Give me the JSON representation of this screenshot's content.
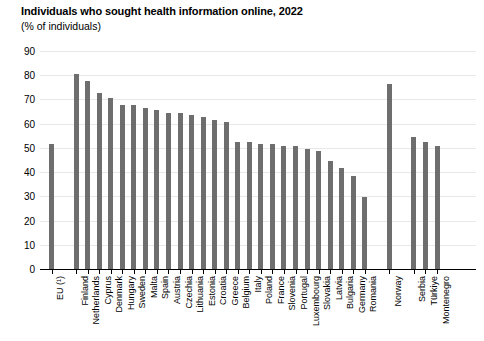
{
  "chart_data": {
    "type": "bar",
    "title": "Individuals who sought health information online, 2022",
    "subtitle": "(% of individuals)",
    "xlabel": "",
    "ylabel": "",
    "ylim": [
      0,
      90
    ],
    "ytick_step": 10,
    "yticks": [
      0,
      10,
      20,
      30,
      40,
      50,
      60,
      70,
      80,
      90
    ],
    "grid": true,
    "legend": "none",
    "bar_color": "#6e6e6e",
    "orientation": "vertical",
    "categories": [
      "EU (¹)",
      "Finland",
      "Netherlands",
      "Cyprus",
      "Denmark",
      "Hungary",
      "Sweden",
      "Malta",
      "Spain",
      "Austria",
      "Czechia",
      "Lithuania",
      "Estonia",
      "Croatia",
      "Greece",
      "Belgium",
      "Italy",
      "Poland",
      "France",
      "Slovenia",
      "Portugal",
      "Luxembourg",
      "Slovakia",
      "Latvia",
      "Bulgaria",
      "Germany",
      "Romania",
      "Norway",
      "Serbia",
      "Türkiye",
      "Montenegro"
    ],
    "values": [
      52,
      81,
      78,
      73,
      71,
      68,
      68,
      67,
      66,
      65,
      65,
      64,
      63,
      62,
      61,
      53,
      53,
      52,
      52,
      51,
      51,
      50,
      49,
      45,
      42,
      39,
      30,
      77,
      55,
      53,
      51
    ],
    "group_gaps_after": [
      "EU (¹)",
      "Romania",
      "Norway"
    ],
    "groups": [
      {
        "name": "eu-aggregate",
        "categories": [
          "EU (¹)"
        ]
      },
      {
        "name": "eu-member-states",
        "categories": [
          "Finland",
          "Netherlands",
          "Cyprus",
          "Denmark",
          "Hungary",
          "Sweden",
          "Malta",
          "Spain",
          "Austria",
          "Czechia",
          "Lithuania",
          "Estonia",
          "Croatia",
          "Greece",
          "Belgium",
          "Italy",
          "Poland",
          "France",
          "Slovenia",
          "Portugal",
          "Luxembourg",
          "Slovakia",
          "Latvia",
          "Bulgaria",
          "Germany",
          "Romania"
        ]
      },
      {
        "name": "efta",
        "categories": [
          "Norway"
        ]
      },
      {
        "name": "candidate-countries",
        "categories": [
          "Serbia",
          "Türkiye",
          "Montenegro"
        ]
      }
    ]
  }
}
